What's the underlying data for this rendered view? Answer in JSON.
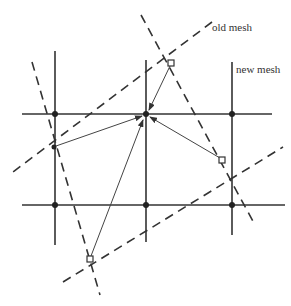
{
  "labels": {
    "old_mesh": "old mesh",
    "new_mesh": "new mesh"
  },
  "colors": {
    "line": "#333333",
    "background": "#ffffff"
  },
  "new_mesh": {
    "horizontal_lines_y": [
      114,
      205
    ],
    "vertical_lines_x": [
      55,
      146,
      232
    ],
    "nodes": [
      [
        55,
        114
      ],
      [
        146,
        114
      ],
      [
        232,
        114
      ],
      [
        55,
        205
      ],
      [
        146,
        205
      ],
      [
        232,
        205
      ]
    ]
  },
  "old_mesh": {
    "nodes": [
      [
        171,
        63
      ],
      [
        222,
        160
      ],
      [
        90,
        259
      ],
      [
        54,
        147
      ]
    ]
  }
}
